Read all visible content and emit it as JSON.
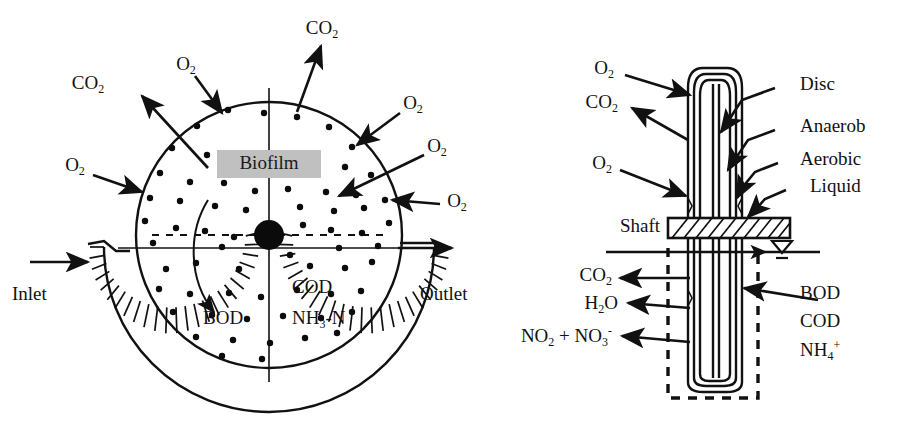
{
  "figure": {
    "background": "#ffffff",
    "ink_color": "#111111",
    "biofilm_box_color": "#c0c0c0",
    "width": 919,
    "height": 439
  },
  "left_panel": {
    "name": "front-view-rotating-disc-in-tank",
    "labels": {
      "biofilm": "Biofilm",
      "inlet": "Inlet",
      "outlet": "Outlet",
      "bod": "BOD",
      "cod": "COD",
      "nh3n": "NH₃-N"
    },
    "gas_labels": [
      {
        "id": "co2-upper-left",
        "text": "CO",
        "sub": "2",
        "direction": "out"
      },
      {
        "id": "co2-top",
        "text": "CO",
        "sub": "2",
        "direction": "out"
      },
      {
        "id": "o2-top-left",
        "text": "O",
        "sub": "2",
        "direction": "in"
      },
      {
        "id": "o2-left",
        "text": "O",
        "sub": "2",
        "direction": "in"
      },
      {
        "id": "o2-upper-right",
        "text": "O",
        "sub": "2",
        "direction": "in"
      },
      {
        "id": "o2-right",
        "text": "O",
        "sub": "2",
        "direction": "in"
      },
      {
        "id": "o2-lower-right",
        "text": "O",
        "sub": "2",
        "direction": "in"
      }
    ]
  },
  "right_panel": {
    "name": "side-view-disc-cross-section",
    "labels": {
      "disc": "Disc",
      "anaerob": "Anaerob",
      "aerobic": "Aerobic",
      "liquid": "Liquid",
      "shaft": "Shaft"
    },
    "gas_in_out": [
      {
        "id": "o2-top",
        "text": "O",
        "sub": "2",
        "direction": "in"
      },
      {
        "id": "co2-upper",
        "text": "CO",
        "sub": "2",
        "direction": "out"
      },
      {
        "id": "o2-mid",
        "text": "O",
        "sub": "2",
        "direction": "in"
      }
    ],
    "products_out": [
      {
        "id": "co2-out",
        "text": "CO",
        "sub": "2",
        "sup": ""
      },
      {
        "id": "h2o-out",
        "text": "H",
        "sub": "2",
        "tail": "O"
      },
      {
        "id": "nox-out",
        "text": "NO",
        "sub": "2",
        "mid": " + NO",
        "sub2": "3",
        "sup2": "-"
      }
    ],
    "substrates_in": [
      {
        "id": "bod-in",
        "text": "BOD"
      },
      {
        "id": "cod-in",
        "text": "COD"
      },
      {
        "id": "nh4-in",
        "text": "NH",
        "sub": "4",
        "sup": "+"
      }
    ]
  }
}
